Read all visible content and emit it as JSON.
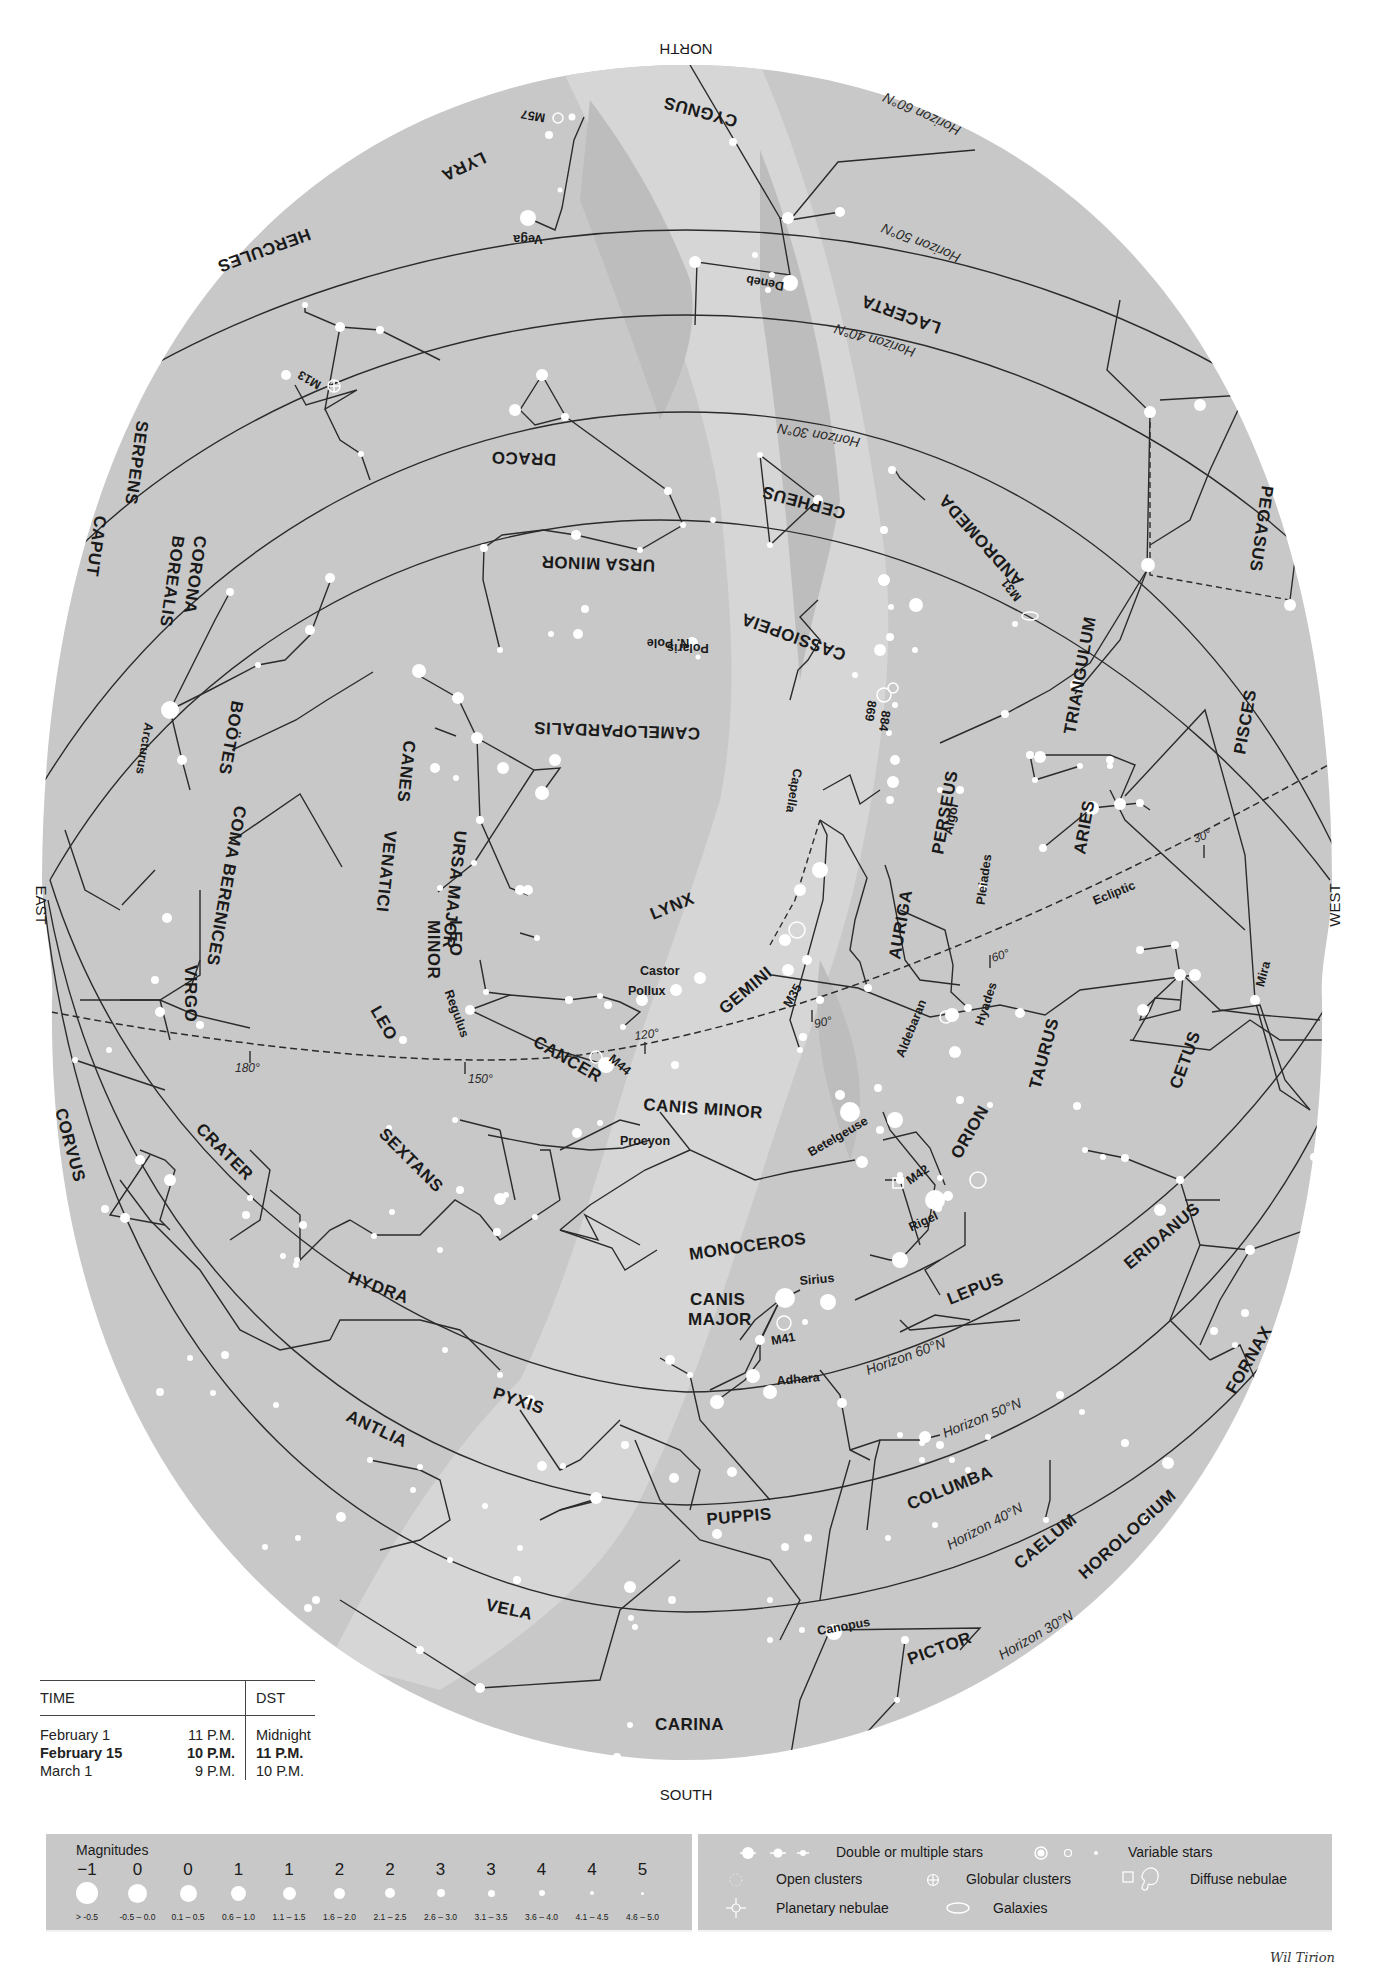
{
  "chart": {
    "title_cardinals": {
      "north": "NORTH",
      "south": "SOUTH",
      "east": "EAST",
      "west": "WEST"
    },
    "colors": {
      "sky": "#c8c8c8",
      "milky_way_light": "#d9d9d9",
      "milky_way_dark": "#bcbcbc",
      "lines": "#2b2b2b",
      "stars": "#ffffff",
      "background": "#ffffff"
    },
    "constellations": [
      "CYGNUS",
      "LYRA",
      "HERCULES",
      "LACERTA",
      "DRACO",
      "CEPHEUS",
      "PEGASUS",
      "SERPENS",
      "CAPUT",
      "CORONA",
      "BOREALIS",
      "URSA MINOR",
      "CASSIOPEIA",
      "ANDROMEDA",
      "BOÖTES",
      "COMA BERENICES",
      "CANES",
      "VENATICI",
      "URSA MAJOR",
      "CAMELOPARDALIS",
      "TRIANGULUM",
      "PISCES",
      "PERSEUS",
      "ARIES",
      "LYNX",
      "AURIGA",
      "LEO",
      "MINOR",
      "VIRGO",
      "LEO",
      "GEMINI",
      "CANCER",
      "TAURUS",
      "CETUS",
      "CANIS MINOR",
      "ORION",
      "CORVUS",
      "CRATER",
      "SEXTANS",
      "MONOCEROS",
      "ERIDANUS",
      "HYDRA",
      "LEPUS",
      "CANIS",
      "MAJOR",
      "FORNAX",
      "PYXIS",
      "ANTLIA",
      "COLUMBA",
      "PUPPIS",
      "CAELUM",
      "HOROLOGIUM",
      "VELA",
      "PICTOR",
      "CARINA"
    ],
    "stars": [
      "Vega",
      "Deneb",
      "Polaris",
      "Arcturus",
      "Capella",
      "Algol",
      "Pleiades",
      "Castor",
      "Pollux",
      "Regulus",
      "Aldebaran",
      "Hyades",
      "Mira",
      "Procyon",
      "Betelgeuse",
      "Rigel",
      "Sirius",
      "Adhara",
      "Canopus"
    ],
    "deep_sky": [
      "M57",
      "M13",
      "M31",
      "884",
      "869",
      "M35",
      "M44",
      "M42",
      "M41",
      "N. Pole"
    ],
    "horizons": [
      "Horizon 60°N",
      "Horizon 50°N",
      "Horizon 40°N",
      "Horizon 30°N"
    ],
    "ecliptic": {
      "label": "Ecliptic",
      "ticks": [
        "30°",
        "60°",
        "90°",
        "120°",
        "150°",
        "180°"
      ]
    }
  },
  "time_table": {
    "headers": {
      "time": "TIME",
      "dst": "DST"
    },
    "rows": [
      {
        "date": "February 1",
        "time": "11 P.M.",
        "dst": "Midnight",
        "bold": false
      },
      {
        "date": "February 15",
        "time": "10 P.M.",
        "dst": "11 P.M.",
        "bold": true
      },
      {
        "date": "March 1",
        "time": "9 P.M.",
        "dst": "10 P.M.",
        "bold": false
      }
    ]
  },
  "magnitude_legend": {
    "title": "Magnitudes",
    "items": [
      {
        "mag": "−1",
        "range": "> -0.5",
        "size": 22
      },
      {
        "mag": "0",
        "range": "-0.5 – 0.0",
        "size": 19
      },
      {
        "mag": "0",
        "range": "0.1 – 0.5",
        "size": 17
      },
      {
        "mag": "1",
        "range": "0.6 – 1.0",
        "size": 15
      },
      {
        "mag": "1",
        "range": "1.1 – 1.5",
        "size": 13
      },
      {
        "mag": "2",
        "range": "1.6 – 2.0",
        "size": 11
      },
      {
        "mag": "2",
        "range": "2.1 – 2.5",
        "size": 10
      },
      {
        "mag": "3",
        "range": "2.6 – 3.0",
        "size": 8
      },
      {
        "mag": "3",
        "range": "3.1 – 3.5",
        "size": 7
      },
      {
        "mag": "4",
        "range": "3.6 – 4.0",
        "size": 6
      },
      {
        "mag": "4",
        "range": "4.1 – 4.5",
        "size": 4
      },
      {
        "mag": "5",
        "range": "4.6 – 5.0",
        "size": 3
      }
    ]
  },
  "symbol_legend": {
    "double_stars": "Double or multiple stars",
    "variable_stars": "Variable stars",
    "open_clusters": "Open clusters",
    "globular_clusters": "Globular clusters",
    "diffuse_nebulae": "Diffuse nebulae",
    "planetary_nebulae": "Planetary nebulae",
    "galaxies": "Galaxies"
  },
  "signature": "Wil Tirion"
}
